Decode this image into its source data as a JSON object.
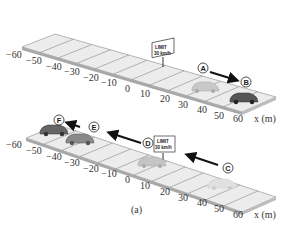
{
  "figure": {
    "caption": "(a)",
    "axis_label": "x (m)",
    "tick_labels": [
      "−60",
      "−50",
      "−40",
      "−30",
      "−20",
      "−10",
      "0",
      "10",
      "20",
      "30",
      "40",
      "50",
      "60"
    ],
    "sign": {
      "line1": "LIMIT",
      "line2": "30 km/h"
    },
    "colors": {
      "road_top": "#ececec",
      "road_side": "#a8a8a8",
      "road_line": "#777777",
      "arrow": "#111111",
      "car_dark": "#555555",
      "car_light": "#bcbcbc"
    }
  },
  "top_panel": {
    "points": [
      {
        "label": "A",
        "name": "point-a"
      },
      {
        "label": "B",
        "name": "point-b"
      }
    ],
    "motion": "positive x direction (A to B)"
  },
  "bottom_panel": {
    "points": [
      {
        "label": "C",
        "name": "point-c"
      },
      {
        "label": "D",
        "name": "point-d"
      },
      {
        "label": "E",
        "name": "point-e"
      },
      {
        "label": "F",
        "name": "point-f"
      }
    ],
    "motion": "negative x direction (C to F)"
  }
}
